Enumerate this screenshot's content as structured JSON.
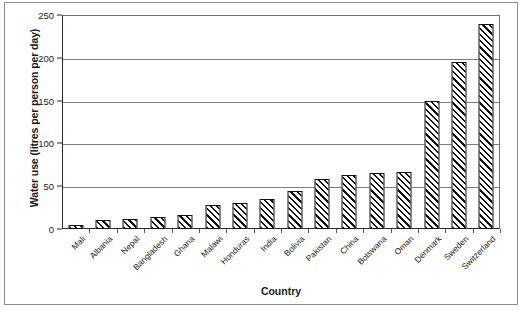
{
  "chart_data": {
    "type": "bar",
    "title": "",
    "xlabel": "Country",
    "ylabel": "Water use (litres per person per day)",
    "categories": [
      "Mali",
      "Albania",
      "Nepal",
      "Bangladesh",
      "Ghana",
      "Malawi",
      "Honduras",
      "India",
      "Bolivia",
      "Pakistan",
      "China",
      "Botswana",
      "Oman",
      "Denmark",
      "Sweden",
      "Switzerland"
    ],
    "values": [
      5,
      10,
      12,
      14,
      16,
      28,
      30,
      35,
      44,
      58,
      63,
      65,
      67,
      150,
      195,
      240
    ],
    "ylim": [
      0,
      250
    ],
    "yticks": [
      0,
      50,
      100,
      150,
      200,
      250
    ],
    "ytick_labels": [
      "0",
      "50",
      "100",
      "150",
      "200",
      "250"
    ],
    "grid": true,
    "legend": "none",
    "bar_style": {
      "fill": "diagonal-hatch",
      "hatch_color": "#111111",
      "background": "#ffffff",
      "outline": "#111111"
    }
  }
}
